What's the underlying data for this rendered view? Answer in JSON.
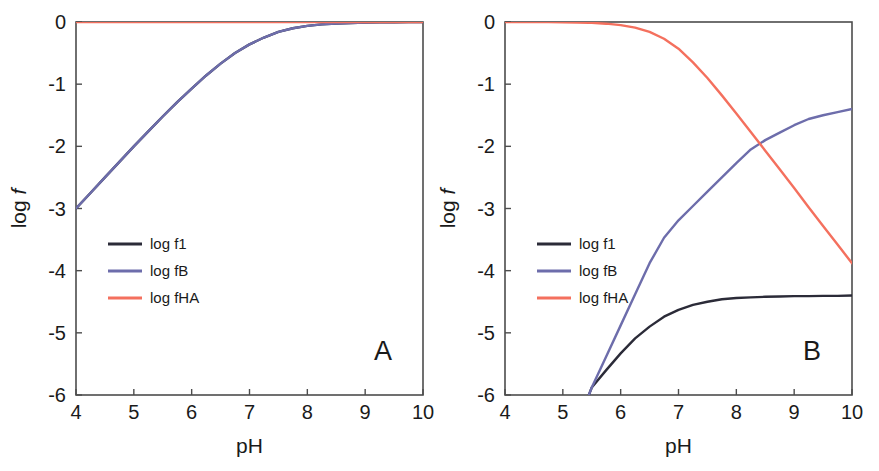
{
  "figure": {
    "background_color": "#ffffff",
    "axis_color": "#4d4d4d",
    "text_color": "#1a1a1a"
  },
  "series_colors": {
    "f1": "#2b2b38",
    "fB": "#6d6dab",
    "fHA": "#f4705e"
  },
  "panels": [
    {
      "id": "A",
      "label": "A",
      "xlabel": "pH",
      "ylabel_prefix": "log ",
      "ylabel_italic": "f",
      "xticks": [
        "4",
        "5",
        "6",
        "7",
        "8",
        "9",
        "10"
      ],
      "yticks": [
        "0",
        "-1",
        "-2",
        "-3",
        "-4",
        "-5",
        "-6"
      ],
      "legend": [
        {
          "label": "log f1",
          "key": "f1"
        },
        {
          "label": "log fB",
          "key": "fB"
        },
        {
          "label": "log fHA",
          "key": "fHA"
        }
      ]
    },
    {
      "id": "B",
      "label": "B",
      "xlabel": "pH",
      "ylabel_prefix": "log ",
      "ylabel_italic": "f",
      "xticks": [
        "4",
        "5",
        "6",
        "7",
        "8",
        "9",
        "10"
      ],
      "yticks": [
        "0",
        "-1",
        "-2",
        "-3",
        "-4",
        "-5",
        "-6"
      ],
      "legend": [
        {
          "label": "log f1",
          "key": "f1"
        },
        {
          "label": "log fB",
          "key": "fB"
        },
        {
          "label": "log fHA",
          "key": "fHA"
        }
      ]
    }
  ],
  "chart_data": [
    {
      "type": "line",
      "panel": "A",
      "title": "A",
      "xlabel": "pH",
      "ylabel": "log f",
      "xlim": [
        4,
        10
      ],
      "ylim": [
        -6,
        0
      ],
      "grid": false,
      "legend_position": "center-left",
      "x": [
        4.0,
        4.25,
        4.5,
        4.75,
        5.0,
        5.25,
        5.5,
        5.75,
        6.0,
        6.25,
        6.5,
        6.75,
        7.0,
        7.25,
        7.5,
        7.75,
        8.0,
        8.25,
        8.5,
        8.75,
        9.0,
        9.25,
        9.5,
        9.75,
        10.0
      ],
      "series": [
        {
          "name": "log f1",
          "color": "#2b2b38",
          "values": [
            -3.0,
            -2.75,
            -2.5,
            -2.25,
            -2.0,
            -1.76,
            -1.52,
            -1.29,
            -1.07,
            -0.86,
            -0.67,
            -0.5,
            -0.36,
            -0.25,
            -0.16,
            -0.1,
            -0.063,
            -0.039,
            -0.024,
            -0.015,
            -0.009,
            -0.006,
            -0.003,
            -0.002,
            -0.001
          ]
        },
        {
          "name": "log fB",
          "color": "#6d6dab",
          "values": [
            -3.0,
            -2.75,
            -2.5,
            -2.25,
            -2.0,
            -1.76,
            -1.52,
            -1.29,
            -1.07,
            -0.86,
            -0.67,
            -0.5,
            -0.36,
            -0.25,
            -0.16,
            -0.1,
            -0.063,
            -0.039,
            -0.024,
            -0.015,
            -0.009,
            -0.006,
            -0.003,
            -0.002,
            -0.001
          ]
        },
        {
          "name": "log fHA",
          "color": "#f4705e",
          "values": [
            0.0,
            0.0,
            0.0,
            0.0,
            0.0,
            0.0,
            0.0,
            0.0,
            0.0,
            0.0,
            0.0,
            0.0,
            0.0,
            0.0,
            0.0,
            0.0,
            0.0,
            0.0,
            0.0,
            0.0,
            0.0,
            0.0,
            0.0,
            0.0,
            0.0
          ]
        }
      ]
    },
    {
      "type": "line",
      "panel": "B",
      "title": "B",
      "xlabel": "pH",
      "ylabel": "log f",
      "xlim": [
        4,
        10
      ],
      "ylim": [
        -6,
        0
      ],
      "grid": false,
      "legend_position": "center-left",
      "x": [
        4.0,
        4.25,
        4.5,
        4.75,
        5.0,
        5.25,
        5.45,
        5.5,
        5.75,
        6.0,
        6.25,
        6.5,
        6.75,
        7.0,
        7.25,
        7.5,
        7.75,
        8.0,
        8.25,
        8.5,
        8.75,
        9.0,
        9.25,
        9.5,
        9.75,
        10.0
      ],
      "series": [
        {
          "name": "log f1",
          "color": "#2b2b38",
          "values": [
            null,
            null,
            null,
            null,
            null,
            null,
            -6.0,
            -5.88,
            -5.6,
            -5.33,
            -5.09,
            -4.9,
            -4.74,
            -4.63,
            -4.55,
            -4.5,
            -4.46,
            -4.44,
            -4.43,
            -4.42,
            -4.415,
            -4.41,
            -4.41,
            -4.405,
            -4.405,
            -4.4
          ]
        },
        {
          "name": "log fB",
          "color": "#6d6dab",
          "values": [
            null,
            null,
            null,
            null,
            null,
            null,
            -6.0,
            -5.88,
            -5.38,
            -4.88,
            -4.38,
            -3.88,
            -3.47,
            -3.19,
            -2.96,
            -2.73,
            -2.5,
            -2.27,
            -2.05,
            -1.9,
            -1.78,
            -1.66,
            -1.56,
            -1.5,
            -1.45,
            -1.4
          ]
        },
        {
          "name": "log fHA",
          "color": "#f4705e",
          "values": [
            0.0,
            0.0,
            0.0,
            -0.001,
            -0.003,
            -0.007,
            -0.012,
            -0.014,
            -0.027,
            -0.05,
            -0.09,
            -0.16,
            -0.27,
            -0.43,
            -0.65,
            -0.9,
            -1.18,
            -1.47,
            -1.77,
            -2.07,
            -2.37,
            -2.67,
            -2.98,
            -3.28,
            -3.58,
            -3.88
          ]
        }
      ]
    }
  ]
}
